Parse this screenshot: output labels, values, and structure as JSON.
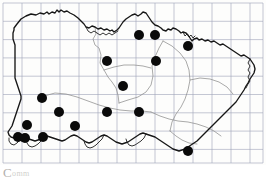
{
  "figure": {
    "kind": "distribution-dot-map",
    "title": "",
    "caption_initial": "C",
    "caption_rest": "omm",
    "caption_full": "C omm"
  },
  "colors": {
    "background": "#ffffff",
    "grid": "#8e93ad",
    "coastline": "#1a1a1a",
    "internal_boundary": "#8b8b8b",
    "dot_fill": "#0a0a0a",
    "caption_text": "#b4b0ac"
  },
  "grid": {
    "visible": true,
    "columns": 14,
    "rows": 9,
    "cell_width_px": 19,
    "cell_height_px": 18.3,
    "origin_x_px": 3,
    "origin_y_px": 3,
    "line_width_px": 0.6
  },
  "frame": {
    "visible": true,
    "left_px": 3,
    "top_px": 3,
    "width_px": 260,
    "height_px": 160
  },
  "chart_data": {
    "type": "scatter",
    "title": "",
    "subtitle": "",
    "xlabel": "",
    "ylabel": "",
    "xlim": [
      0,
      266
    ],
    "ylim": [
      0,
      165
    ],
    "grid": true,
    "legend": "none",
    "point_count": 18,
    "point_radius_px": 5,
    "series": [
      {
        "name": "records",
        "marker": "filled-circle",
        "color": "#0a0a0a",
        "points": [
          {
            "id": "p01",
            "x": 139,
            "y": 35
          },
          {
            "id": "p02",
            "x": 155,
            "y": 35
          },
          {
            "id": "p03",
            "x": 188,
            "y": 46
          },
          {
            "id": "p04",
            "x": 107,
            "y": 61
          },
          {
            "id": "p05",
            "x": 156,
            "y": 61
          },
          {
            "id": "p06",
            "x": 123,
            "y": 86
          },
          {
            "id": "p07",
            "x": 42,
            "y": 98
          },
          {
            "id": "p08",
            "x": 59,
            "y": 112
          },
          {
            "id": "p09",
            "x": 107,
            "y": 112
          },
          {
            "id": "p10",
            "x": 139,
            "y": 112
          },
          {
            "id": "p11",
            "x": 27,
            "y": 125
          },
          {
            "id": "p12",
            "x": 75,
            "y": 126
          },
          {
            "id": "p13",
            "x": 18,
            "y": 137
          },
          {
            "id": "p14",
            "x": 25,
            "y": 138
          },
          {
            "id": "p15",
            "x": 43,
            "y": 137
          },
          {
            "id": "p16",
            "x": 188,
            "y": 151
          }
        ]
      }
    ]
  },
  "map": {
    "outline_name": "region-coastline",
    "has_internal_boundaries": true,
    "internal_region_count": 6
  }
}
